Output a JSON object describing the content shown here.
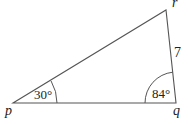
{
  "diagram": {
    "type": "triangle",
    "vertices": {
      "p": {
        "label": "p",
        "x": 13,
        "y": 103
      },
      "q": {
        "label": "q",
        "x": 176,
        "y": 103
      },
      "r": {
        "label": "r",
        "x": 166,
        "y": 10
      }
    },
    "angles": {
      "p": "30°",
      "q": "84°"
    },
    "sides": {
      "qr": "7"
    },
    "colors": {
      "line": "#555555",
      "text": "#222222"
    }
  }
}
